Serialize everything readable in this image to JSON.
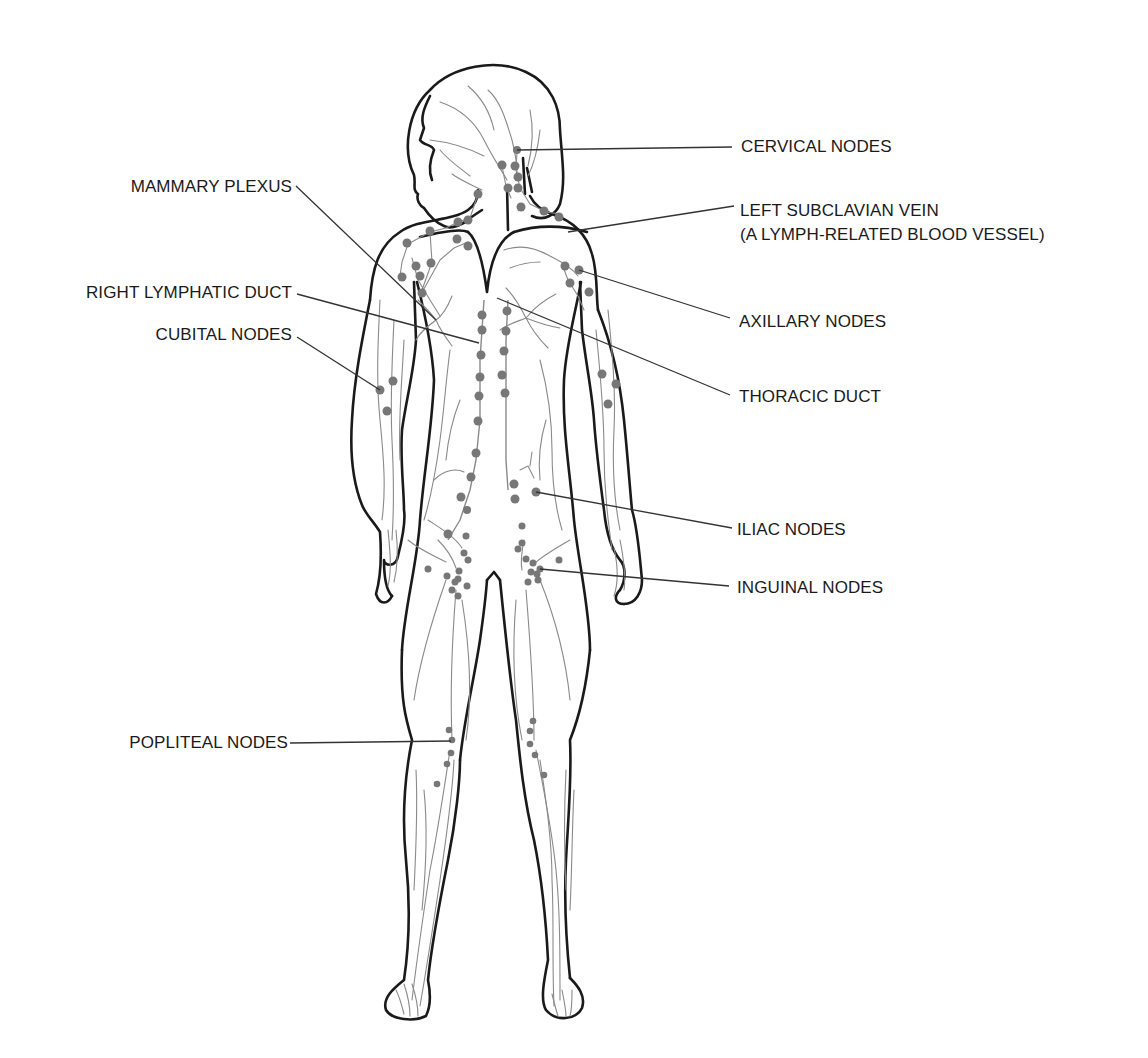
{
  "labels": {
    "cervical_nodes": "CERVICAL NODES",
    "left_subclavian_vein_line1": "LEFT SUBCLAVIAN VEIN",
    "left_subclavian_vein_line2": "(A LYMPH-RELATED BLOOD VESSEL)",
    "axillary_nodes": "AXILLARY NODES",
    "thoracic_duct": "THORACIC DUCT",
    "iliac_nodes": "ILIAC NODES",
    "inguinal_nodes": "INGUINAL NODES",
    "mammary_plexus": "MAMMARY PLEXUS",
    "right_lymphatic_duct": "RIGHT LYMPHATIC DUCT",
    "cubital_nodes": "CUBITAL NODES",
    "popliteal_nodes": "POPLITEAL NODES"
  },
  "colors": {
    "outline": "#1a1a1a",
    "vessel": "#8a8a8a",
    "node": "#777777",
    "background": "#ffffff"
  }
}
